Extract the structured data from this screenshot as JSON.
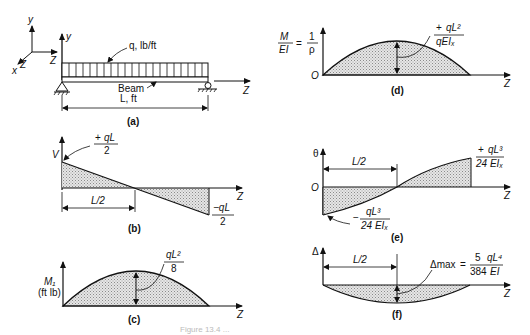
{
  "figure": {
    "caption_faded": "Figure 13.4 ...",
    "panels": {
      "a": {
        "label": "(a)",
        "coord_axes": {
          "y": "y",
          "z": "Z",
          "x": "x"
        },
        "beam_axis_y": "y",
        "beam_axis_z": "Z",
        "load_label": "q, lb/ft",
        "beam_label": "Beam",
        "span_label": "L, ft"
      },
      "b": {
        "label": "(b)",
        "y_axis": "V",
        "x_axis": "Z",
        "left_value": {
          "sign": "+",
          "num": "qL",
          "den": "2"
        },
        "right_value": {
          "num": "−qL",
          "den": "2"
        },
        "half_span": "L/2"
      },
      "c": {
        "label": "(c)",
        "y_axis_line1": "M₁",
        "y_axis_line2": "(ft lb)",
        "x_axis": "Z",
        "peak_value": {
          "num": "qL²",
          "den": "8"
        }
      },
      "d": {
        "label": "(d)",
        "y_axis_lhs_num": "M",
        "y_axis_lhs_den": "EI",
        "y_axis_eq": "=",
        "y_axis_rhs_num": "1",
        "y_axis_rhs_den": "ρ",
        "origin": "O",
        "x_axis": "Z",
        "peak_value": {
          "sign": "+",
          "num": "qL²",
          "den": "qEIₓ"
        }
      },
      "e": {
        "label": "(e)",
        "y_axis": "θ",
        "origin": "O",
        "x_axis": "Z",
        "half_span": "L/2",
        "right_value": {
          "sign": "+",
          "num": "qL³",
          "den": "24 EIₓ"
        },
        "left_value": {
          "sign": "−",
          "num": "qL³",
          "den": "24 EIₓ"
        }
      },
      "f": {
        "label": "(f)",
        "y_axis": "Δ",
        "x_axis": "Z",
        "half_span": "L/2",
        "max_label": "Δmax",
        "max_eq": "=",
        "max_value": {
          "coef_num": "5",
          "coef_den": "384",
          "num": "qL⁴",
          "den": "EI"
        }
      }
    }
  }
}
